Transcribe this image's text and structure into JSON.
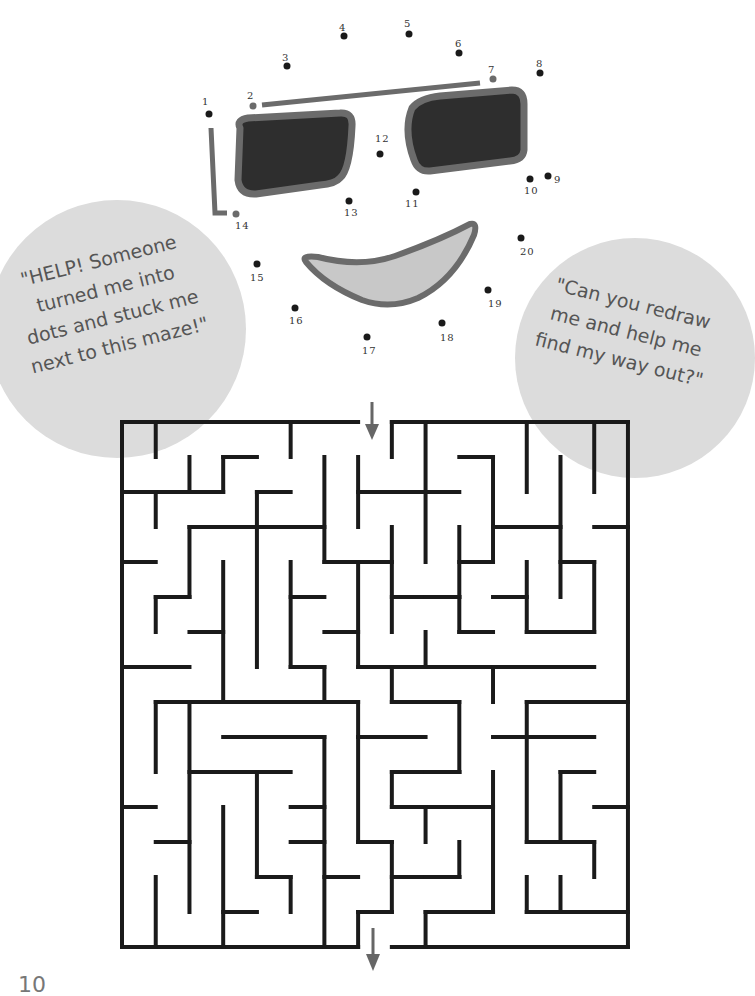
{
  "page": {
    "page_number": "10"
  },
  "bubbles": {
    "left": {
      "lines": [
        "\"HELP!  Someone",
        "turned me into",
        "dots and stuck me",
        "next to this maze!\""
      ]
    },
    "right": {
      "lines": [
        "\"Can you redraw",
        "me and help me",
        "find my way out?\""
      ]
    }
  },
  "colors": {
    "bubble": "#dcdcdc",
    "frame": "#6b6b6b",
    "lens": "#2e2e2e",
    "mouth_fill": "#c8c8c8",
    "dot": "#1a1a1a",
    "maze_wall": "#1a1a1a",
    "arrow": "#666666"
  },
  "dots": [
    {
      "n": "1",
      "x": 209,
      "y": 114,
      "lx": 202,
      "ly": 96
    },
    {
      "n": "2",
      "x": 253,
      "y": 106,
      "lx": 247,
      "ly": 90
    },
    {
      "n": "3",
      "x": 287,
      "y": 66,
      "lx": 282,
      "ly": 52
    },
    {
      "n": "4",
      "x": 344,
      "y": 36,
      "lx": 339,
      "ly": 22
    },
    {
      "n": "5",
      "x": 409,
      "y": 34,
      "lx": 404,
      "ly": 18
    },
    {
      "n": "6",
      "x": 459,
      "y": 53,
      "lx": 455,
      "ly": 38
    },
    {
      "n": "7",
      "x": 493,
      "y": 79,
      "lx": 488,
      "ly": 64
    },
    {
      "n": "8",
      "x": 540,
      "y": 73,
      "lx": 536,
      "ly": 58
    },
    {
      "n": "9",
      "x": 548,
      "y": 176,
      "lx": 554,
      "ly": 174
    },
    {
      "n": "10",
      "x": 530,
      "y": 179,
      "lx": 524,
      "ly": 185
    },
    {
      "n": "11",
      "x": 416,
      "y": 192,
      "lx": 405,
      "ly": 198
    },
    {
      "n": "12",
      "x": 380,
      "y": 154,
      "lx": 375,
      "ly": 133
    },
    {
      "n": "13",
      "x": 349,
      "y": 201,
      "lx": 344,
      "ly": 207
    },
    {
      "n": "14",
      "x": 236,
      "y": 214,
      "lx": 235,
      "ly": 220
    },
    {
      "n": "15",
      "x": 257,
      "y": 264,
      "lx": 250,
      "ly": 272
    },
    {
      "n": "16",
      "x": 295,
      "y": 308,
      "lx": 289,
      "ly": 315
    },
    {
      "n": "17",
      "x": 367,
      "y": 337,
      "lx": 362,
      "ly": 345
    },
    {
      "n": "18",
      "x": 442,
      "y": 323,
      "lx": 440,
      "ly": 332
    },
    {
      "n": "19",
      "x": 488,
      "y": 290,
      "lx": 488,
      "ly": 298
    },
    {
      "n": "20",
      "x": 521,
      "y": 238,
      "lx": 520,
      "ly": 246
    }
  ],
  "maze": {
    "cols": 15,
    "rows": 15,
    "origin_x": 122,
    "origin_y": 422,
    "cell_w": 33.73,
    "cell_h": 35,
    "entrance_col": 7,
    "exit_col": 7,
    "walls": [
      [
        0,
        0,
        7,
        0
      ],
      [
        8,
        0,
        15,
        0
      ],
      [
        0,
        0,
        0,
        15
      ],
      [
        15,
        0,
        15,
        15
      ],
      [
        0,
        15,
        7,
        15
      ],
      [
        8,
        15,
        15,
        15
      ],
      [
        1,
        0,
        1,
        1
      ],
      [
        5,
        0,
        5,
        1
      ],
      [
        8,
        0,
        8,
        1
      ],
      [
        9,
        0,
        9,
        4
      ],
      [
        12,
        0,
        12,
        2
      ],
      [
        14,
        0,
        14,
        2
      ],
      [
        2,
        1,
        2,
        2
      ],
      [
        3,
        1,
        3,
        2
      ],
      [
        3,
        1,
        4,
        1
      ],
      [
        6,
        1,
        6,
        4
      ],
      [
        7,
        1,
        7,
        3
      ],
      [
        10,
        1,
        11,
        1
      ],
      [
        11,
        1,
        11,
        4
      ],
      [
        13,
        1,
        13,
        5
      ],
      [
        0,
        2,
        3,
        2
      ],
      [
        1,
        2,
        1,
        3
      ],
      [
        4,
        2,
        5,
        2
      ],
      [
        4,
        2,
        4,
        7
      ],
      [
        7,
        2,
        10,
        2
      ],
      [
        2,
        3,
        6,
        3
      ],
      [
        2,
        3,
        2,
        5
      ],
      [
        8,
        3,
        8,
        6
      ],
      [
        10,
        3,
        10,
        6
      ],
      [
        11,
        3,
        13,
        3
      ],
      [
        14,
        3,
        15,
        3
      ],
      [
        0,
        4,
        1,
        4
      ],
      [
        3,
        4,
        3,
        8
      ],
      [
        5,
        4,
        5,
        7
      ],
      [
        6,
        4,
        8,
        4
      ],
      [
        7,
        4,
        7,
        7
      ],
      [
        10,
        4,
        11,
        4
      ],
      [
        12,
        4,
        12,
        6
      ],
      [
        13,
        4,
        14,
        4
      ],
      [
        14,
        4,
        14,
        6
      ],
      [
        1,
        5,
        2,
        5
      ],
      [
        1,
        5,
        1,
        6
      ],
      [
        5,
        5,
        6,
        5
      ],
      [
        8,
        5,
        10,
        5
      ],
      [
        9,
        5,
        10,
        5
      ],
      [
        11,
        5,
        12,
        5
      ],
      [
        2,
        6,
        3,
        6
      ],
      [
        6,
        6,
        7,
        6
      ],
      [
        9,
        6,
        9,
        7
      ],
      [
        10,
        6,
        11,
        6
      ],
      [
        12,
        6,
        14,
        6
      ],
      [
        0,
        7,
        2,
        7
      ],
      [
        5,
        7,
        6,
        7
      ],
      [
        6,
        7,
        6,
        8
      ],
      [
        7,
        7,
        14,
        7
      ],
      [
        8,
        7,
        8,
        8
      ],
      [
        11,
        7,
        11,
        8
      ],
      [
        1,
        8,
        7,
        8
      ],
      [
        1,
        8,
        1,
        10
      ],
      [
        2,
        8,
        2,
        14
      ],
      [
        7,
        8,
        7,
        9
      ],
      [
        8,
        8,
        10,
        8
      ],
      [
        10,
        8,
        10,
        10
      ],
      [
        12,
        8,
        15,
        8
      ],
      [
        12,
        8,
        12,
        12
      ],
      [
        3,
        9,
        6,
        9
      ],
      [
        6,
        9,
        6,
        15
      ],
      [
        7,
        9,
        9,
        9
      ],
      [
        7,
        9,
        7,
        12
      ],
      [
        11,
        9,
        14,
        9
      ],
      [
        2,
        10,
        5,
        10
      ],
      [
        4,
        10,
        4,
        13
      ],
      [
        8,
        10,
        10,
        10
      ],
      [
        8,
        10,
        8,
        11
      ],
      [
        9,
        10,
        10,
        10
      ],
      [
        11,
        10,
        11,
        14
      ],
      [
        13,
        10,
        14,
        10
      ],
      [
        13,
        10,
        13,
        12
      ],
      [
        0,
        11,
        1,
        11
      ],
      [
        5,
        11,
        6,
        11
      ],
      [
        8,
        11,
        10,
        11
      ],
      [
        9,
        11,
        9,
        12
      ],
      [
        10,
        11,
        11,
        11
      ],
      [
        14,
        11,
        15,
        11
      ],
      [
        1,
        12,
        2,
        12
      ],
      [
        5,
        12,
        6,
        12
      ],
      [
        7,
        12,
        8,
        12
      ],
      [
        8,
        12,
        8,
        14
      ],
      [
        10,
        12,
        10,
        13
      ],
      [
        12,
        12,
        14,
        12
      ],
      [
        14,
        12,
        14,
        13
      ],
      [
        1,
        13,
        1,
        15
      ],
      [
        3,
        11,
        3,
        15
      ],
      [
        4,
        13,
        5,
        13
      ],
      [
        5,
        13,
        5,
        14
      ],
      [
        6,
        13,
        7,
        13
      ],
      [
        8,
        13,
        10,
        13
      ],
      [
        9,
        13,
        10,
        13
      ],
      [
        12,
        13,
        12,
        14
      ],
      [
        13,
        13,
        13,
        14
      ],
      [
        3,
        14,
        4,
        14
      ],
      [
        7,
        14,
        8,
        14
      ],
      [
        7,
        14,
        7,
        15
      ],
      [
        9,
        14,
        11,
        14
      ],
      [
        9,
        14,
        9,
        15
      ],
      [
        12,
        14,
        15,
        14
      ]
    ]
  }
}
